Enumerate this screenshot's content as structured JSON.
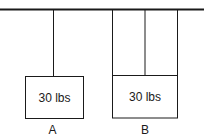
{
  "diagram": {
    "type": "hanging-weights",
    "ceiling": {
      "label": ""
    },
    "weights": [
      {
        "id": "A",
        "label": "A",
        "weight_text": "30 lbs",
        "rope_count": 1
      },
      {
        "id": "B",
        "label": "B",
        "weight_text": "30 lbs",
        "rope_count": 3
      }
    ],
    "colors": {
      "line": "#1a1a1a",
      "background": "#ffffff"
    }
  }
}
